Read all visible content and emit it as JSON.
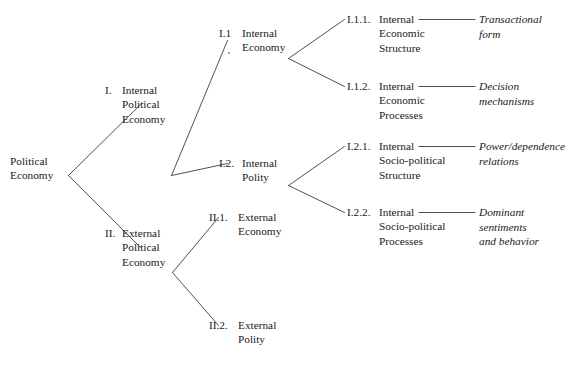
{
  "diagram": {
    "title": "Political Economy",
    "type": "hierarchical-tree",
    "levels": 4,
    "line_color": "#3c3c4a",
    "text_color": "#1a1a1a",
    "background": "#ffffff",
    "root": {
      "label_line1": "Political",
      "label_line2": "Economy"
    },
    "level2": [
      {
        "numeral": "I.",
        "line1": "Internal",
        "line2": "Political",
        "line3": "Economy"
      },
      {
        "numeral": "II.",
        "line1": "External",
        "line2": "Political",
        "line3": "Economy"
      }
    ],
    "level3": [
      {
        "numeral": "I.1",
        "line1": "Internal",
        "line2": "Economy"
      },
      {
        "numeral": "I.2.",
        "line1": "Internal",
        "line2": "Polity"
      },
      {
        "numeral": "II.1.",
        "line1": "External",
        "line2": "Economy"
      },
      {
        "numeral": "II.2.",
        "line1": "External",
        "line2": "Polity"
      }
    ],
    "level4": [
      {
        "numeral": "I.1.1.",
        "line1": "Internal",
        "line2": "Economic",
        "line3": "Structure",
        "annotation_line1": "Transactional",
        "annotation_line2": "form",
        "annotation_line3": ""
      },
      {
        "numeral": "I.1.2.",
        "line1": "Internal",
        "line2": "Economic",
        "line3": "Processes",
        "annotation_line1": "Decision",
        "annotation_line2": "mechanisms",
        "annotation_line3": ""
      },
      {
        "numeral": "I.2.1.",
        "line1": "Internal",
        "line2": "Socio-political",
        "line3": "Structure",
        "annotation_line1": "Power/dependence",
        "annotation_line2": "relations",
        "annotation_line3": ""
      },
      {
        "numeral": "I.2.2.",
        "line1": "Internal",
        "line2": "Socio-political",
        "line3": "Processes",
        "annotation_line1": "Dominant",
        "annotation_line2": "sentiments",
        "annotation_line3": "and behavior"
      }
    ]
  }
}
